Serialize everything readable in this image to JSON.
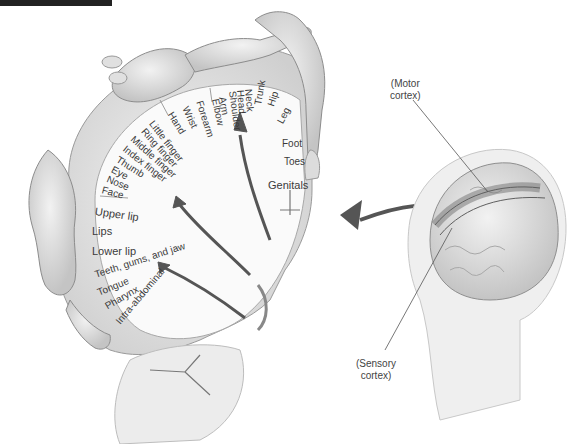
{
  "figure": {
    "colors": {
      "background": "#ffffff",
      "tissue": "#d9d9d9",
      "tissue_dark": "#9a9a9a",
      "arrow": "#555555",
      "motor_strip": "#8a8a8a",
      "label_text": "#3a3a3a"
    }
  },
  "homunculus": {
    "labels": [
      {
        "text": "Genitals",
        "x": 268,
        "y": 180,
        "rot": 0
      },
      {
        "text": "Toes",
        "x": 284,
        "y": 157,
        "rot": 0
      },
      {
        "text": "Foot",
        "x": 282,
        "y": 139,
        "rot": 0
      },
      {
        "text": "Leg",
        "x": 280,
        "y": 118,
        "rot": -62
      },
      {
        "text": "Hip",
        "x": 271,
        "y": 101,
        "rot": -72
      },
      {
        "text": "Trunk",
        "x": 258,
        "y": 100,
        "rot": -80
      },
      {
        "text": "Neck",
        "x": 248,
        "y": 84,
        "rot": 85
      },
      {
        "text": "Head",
        "x": 240,
        "y": 85,
        "rot": 85
      },
      {
        "text": "Shoulder",
        "x": 232,
        "y": 86,
        "rot": 82
      },
      {
        "text": "Arm",
        "x": 222,
        "y": 92,
        "rot": 80
      },
      {
        "text": "Elbow",
        "x": 215,
        "y": 94,
        "rot": 78
      },
      {
        "text": "Forearm",
        "x": 199,
        "y": 96,
        "rot": 72
      },
      {
        "text": "Wrist",
        "x": 185,
        "y": 102,
        "rot": 65
      },
      {
        "text": "Hand",
        "x": 170,
        "y": 108,
        "rot": 58
      },
      {
        "text": "Little finger",
        "x": 151,
        "y": 117,
        "rot": 52
      },
      {
        "text": "Ring finger",
        "x": 143,
        "y": 125,
        "rot": 48
      },
      {
        "text": "Middle finger",
        "x": 132,
        "y": 133,
        "rot": 42
      },
      {
        "text": "Index finger",
        "x": 124,
        "y": 143,
        "rot": 38
      },
      {
        "text": "Thumb",
        "x": 117,
        "y": 154,
        "rot": 32
      },
      {
        "text": "Eye",
        "x": 112,
        "y": 164,
        "rot": 28
      },
      {
        "text": "Nose",
        "x": 107,
        "y": 174,
        "rot": 22
      },
      {
        "text": "Face",
        "x": 102,
        "y": 185,
        "rot": 15
      },
      {
        "text": "Upper lip",
        "x": 95,
        "y": 206,
        "rot": 8
      },
      {
        "text": "Lips",
        "x": 92,
        "y": 226,
        "rot": 0
      },
      {
        "text": "Lower lip",
        "x": 92,
        "y": 246,
        "rot": 0
      },
      {
        "text": "Teeth, gums, and jaw",
        "x": 95,
        "y": 270,
        "rot": -18
      },
      {
        "text": "Tongue",
        "x": 98,
        "y": 288,
        "rot": -22
      },
      {
        "text": "Pharynx",
        "x": 106,
        "y": 302,
        "rot": -30
      },
      {
        "text": "Intra-abdominal",
        "x": 118,
        "y": 318,
        "rot": -50
      }
    ]
  },
  "callouts": {
    "motor": {
      "line1": "(Motor",
      "line2": "cortex)"
    },
    "sensory": {
      "line1": "(Sensory",
      "line2": "cortex)"
    }
  }
}
